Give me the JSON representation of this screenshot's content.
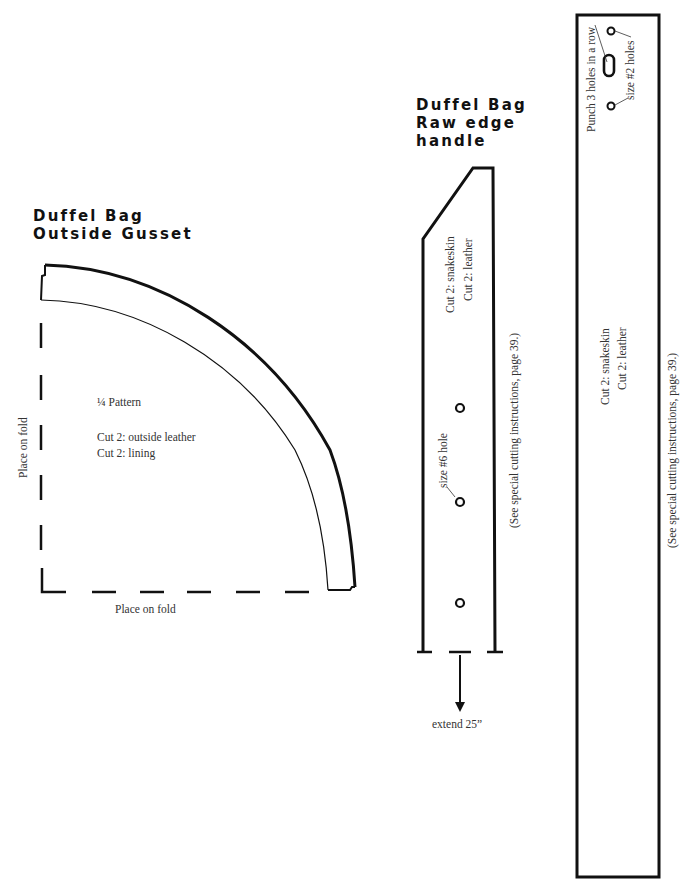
{
  "gusset": {
    "title_line1": "Duffel Bag",
    "title_line2": "Outside Gusset",
    "pattern_label": "¼ Pattern",
    "cut_outside": "Cut 2: outside leather",
    "cut_lining": "Cut 2: lining",
    "fold_left": "Place on fold",
    "fold_bottom": "Place on fold"
  },
  "handle": {
    "title_line1": "Duffel Bag",
    "title_line2": "Raw edge",
    "title_line3": "handle",
    "cut_snakeskin": "Cut 2: snakeskin",
    "cut_leather": "Cut 2: leather",
    "hole_label": "size #6 hole",
    "instructions": "(See special cutting instructions, page 39.)",
    "extend_label": "extend 25”"
  },
  "strap": {
    "punch_label": "Punch 3 holes in a row",
    "hole_size_label": "size #2 holes",
    "cut_snakeskin": "Cut 2: snakeskin",
    "cut_leather": "Cut 2: leather",
    "instructions": "(See special cutting instructions, page 39.)"
  }
}
